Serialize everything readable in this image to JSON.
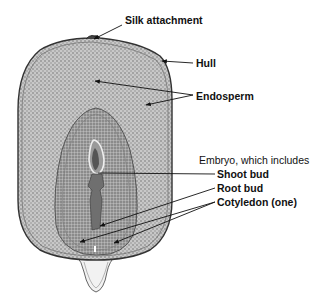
{
  "diagram": {
    "labels": {
      "silk_attachment": "Silk attachment",
      "hull": "Hull",
      "endosperm": "Endosperm",
      "embryo": "Embryo, which includes",
      "shoot_bud": "Shoot bud",
      "root_bud": "Root bud",
      "cotyledon": "Cotyledon (one)"
    },
    "colors": {
      "ink": "#111111",
      "texture_dark": "#6a6a6a",
      "texture_mid": "#a8a8a8",
      "texture_light": "#cfcfcf",
      "background": "#ffffff"
    }
  }
}
